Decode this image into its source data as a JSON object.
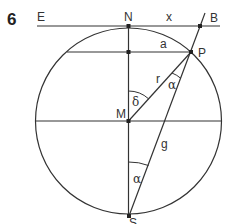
{
  "problem": {
    "number": "6"
  },
  "diagram": {
    "points": {
      "E": "E",
      "N": "N",
      "B": "B",
      "P": "P",
      "M": "M",
      "S": "S"
    },
    "segments": {
      "x": "x",
      "a": "a",
      "r": "r",
      "g": "g"
    },
    "angles": {
      "alpha_top": "α",
      "delta": "δ",
      "alpha_bottom": "α"
    },
    "colors": {
      "stroke": "#333333",
      "background": "#ffffff"
    }
  }
}
